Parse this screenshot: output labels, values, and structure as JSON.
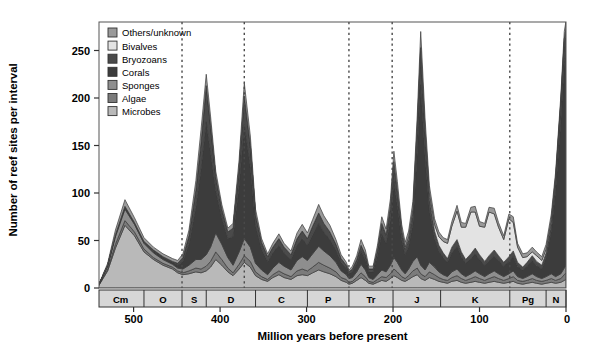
{
  "figure": {
    "ylabel": "Number of reef sites per interval",
    "xlabel": "Million years before present"
  },
  "chart_data": {
    "type": "area",
    "stacked": true,
    "title": "",
    "xlabel": "Million years before present",
    "ylabel": "Number of reef sites per interval",
    "xlim": [
      540,
      0
    ],
    "ylim": [
      0,
      280
    ],
    "x_reversed": true,
    "grid": false,
    "legend_position": "top-left",
    "xticks": [
      500,
      400,
      300,
      200,
      100,
      0
    ],
    "yticks": [
      0,
      50,
      100,
      150,
      200,
      250
    ],
    "colors": {
      "Others/unknown": "#9a9a9a",
      "Bivalves": "#e3e3e3",
      "Bryozoans": "#4a4a4a",
      "Corals": "#3c3c3c",
      "Sponges": "#8e8e8e",
      "Algae": "#7b7b7b",
      "Microbes": "#b9b9b9"
    },
    "legend": [
      "Others/unknown",
      "Bivalves",
      "Bryozoans",
      "Corals",
      "Sponges",
      "Algae",
      "Microbes"
    ],
    "stack_order_bottom_to_top": [
      "Microbes",
      "Algae",
      "Sponges",
      "Corals",
      "Bryozoans",
      "Bivalves",
      "Others/unknown"
    ],
    "x": [
      542,
      530,
      521,
      510,
      499,
      488,
      477,
      466,
      455,
      449,
      443,
      436,
      428,
      422,
      416,
      411,
      405,
      398,
      391,
      385,
      378,
      372,
      365,
      359,
      352,
      345,
      339,
      332,
      326,
      318,
      311,
      305,
      299,
      293,
      286,
      280,
      273,
      266,
      260,
      254,
      251,
      247,
      242,
      237,
      232,
      228,
      223,
      218,
      213,
      208,
      203,
      199,
      195,
      190,
      186,
      182,
      177,
      172,
      168,
      163,
      158,
      152,
      147,
      142,
      137,
      132,
      126,
      121,
      116,
      110,
      105,
      100,
      94,
      89,
      83,
      78,
      72,
      66,
      61,
      56,
      50,
      45,
      39,
      34,
      28,
      23,
      17,
      12,
      6,
      2,
      0
    ],
    "series": [
      {
        "name": "Microbes",
        "values": [
          0,
          18,
          42,
          66,
          55,
          38,
          30,
          24,
          20,
          16,
          14,
          15,
          17,
          16,
          18,
          22,
          30,
          24,
          17,
          13,
          20,
          27,
          22,
          13,
          9,
          7,
          11,
          14,
          11,
          9,
          13,
          14,
          13,
          16,
          19,
          17,
          15,
          12,
          8,
          6,
          4,
          5,
          8,
          11,
          8,
          5,
          4,
          6,
          8,
          7,
          10,
          13,
          11,
          8,
          7,
          9,
          12,
          14,
          10,
          8,
          11,
          9,
          7,
          6,
          5,
          7,
          8,
          6,
          5,
          6,
          7,
          6,
          5,
          6,
          7,
          6,
          5,
          6,
          7,
          5,
          4,
          5,
          6,
          5,
          4,
          5,
          6,
          5,
          6,
          8,
          9
        ]
      },
      {
        "name": "Algae",
        "values": [
          0,
          2,
          4,
          5,
          4,
          3,
          2,
          2,
          2,
          2,
          2,
          3,
          4,
          4,
          5,
          6,
          8,
          6,
          4,
          3,
          5,
          7,
          6,
          4,
          3,
          2,
          3,
          4,
          4,
          3,
          5,
          6,
          5,
          6,
          8,
          7,
          6,
          5,
          3,
          3,
          2,
          2,
          3,
          5,
          4,
          2,
          2,
          3,
          4,
          4,
          5,
          7,
          6,
          4,
          3,
          4,
          6,
          7,
          5,
          4,
          6,
          5,
          4,
          3,
          3,
          4,
          5,
          4,
          3,
          4,
          5,
          4,
          3,
          4,
          5,
          4,
          3,
          4,
          5,
          3,
          3,
          3,
          4,
          3,
          3,
          3,
          4,
          3,
          4,
          6,
          7
        ]
      },
      {
        "name": "Sponges",
        "values": [
          0,
          3,
          8,
          12,
          8,
          6,
          5,
          4,
          3,
          3,
          4,
          6,
          9,
          10,
          12,
          15,
          20,
          16,
          11,
          8,
          13,
          18,
          15,
          9,
          7,
          5,
          7,
          9,
          8,
          7,
          11,
          13,
          11,
          14,
          17,
          15,
          13,
          10,
          7,
          5,
          4,
          4,
          6,
          9,
          7,
          4,
          3,
          5,
          7,
          6,
          9,
          12,
          10,
          7,
          5,
          7,
          10,
          12,
          9,
          7,
          10,
          8,
          6,
          5,
          4,
          6,
          7,
          5,
          4,
          5,
          6,
          5,
          4,
          5,
          6,
          5,
          4,
          5,
          6,
          4,
          3,
          4,
          5,
          4,
          3,
          4,
          5,
          4,
          5,
          7,
          8
        ]
      },
      {
        "name": "Corals",
        "values": [
          0,
          1,
          2,
          3,
          2,
          2,
          2,
          2,
          2,
          3,
          8,
          22,
          55,
          95,
          140,
          100,
          45,
          28,
          20,
          30,
          70,
          120,
          85,
          40,
          22,
          14,
          16,
          18,
          14,
          11,
          16,
          19,
          16,
          20,
          24,
          20,
          17,
          13,
          9,
          7,
          5,
          6,
          9,
          14,
          11,
          6,
          8,
          20,
          38,
          30,
          48,
          80,
          60,
          32,
          20,
          24,
          40,
          110,
          190,
          120,
          55,
          30,
          22,
          18,
          15,
          20,
          24,
          18,
          14,
          16,
          18,
          15,
          12,
          14,
          16,
          14,
          11,
          13,
          15,
          11,
          9,
          11,
          14,
          12,
          10,
          20,
          45,
          90,
          160,
          215,
          225
        ]
      },
      {
        "name": "Bryozoans",
        "values": [
          0,
          0,
          0,
          0,
          0,
          0,
          1,
          1,
          1,
          2,
          4,
          9,
          18,
          28,
          38,
          28,
          14,
          9,
          7,
          9,
          18,
          30,
          22,
          11,
          7,
          5,
          6,
          7,
          6,
          5,
          7,
          8,
          7,
          9,
          11,
          9,
          8,
          6,
          4,
          3,
          2,
          3,
          4,
          6,
          5,
          3,
          3,
          6,
          10,
          8,
          12,
          18,
          14,
          8,
          6,
          7,
          11,
          22,
          35,
          24,
          13,
          8,
          6,
          5,
          4,
          6,
          7,
          5,
          4,
          5,
          6,
          5,
          4,
          5,
          6,
          5,
          4,
          5,
          6,
          4,
          3,
          4,
          5,
          4,
          4,
          5,
          8,
          12,
          18,
          22,
          20
        ]
      },
      {
        "name": "Bivalves",
        "values": [
          0,
          0,
          0,
          0,
          0,
          0,
          0,
          0,
          0,
          0,
          0,
          0,
          0,
          0,
          0,
          0,
          0,
          0,
          0,
          0,
          0,
          0,
          0,
          0,
          0,
          0,
          0,
          0,
          0,
          0,
          0,
          0,
          0,
          0,
          0,
          0,
          0,
          0,
          0,
          0,
          0,
          0,
          0,
          0,
          0,
          0,
          0,
          0,
          1,
          1,
          2,
          3,
          2,
          2,
          2,
          3,
          4,
          5,
          4,
          4,
          5,
          7,
          9,
          12,
          16,
          22,
          30,
          26,
          34,
          44,
          38,
          30,
          36,
          46,
          38,
          30,
          24,
          40,
          30,
          16,
          10,
          6,
          4,
          6,
          5,
          4,
          4,
          3,
          3,
          4,
          4
        ]
      },
      {
        "name": "Others/unknown",
        "values": [
          0,
          2,
          5,
          7,
          5,
          4,
          3,
          3,
          3,
          3,
          4,
          6,
          10,
          14,
          12,
          10,
          6,
          5,
          4,
          5,
          9,
          14,
          10,
          6,
          4,
          3,
          4,
          5,
          4,
          4,
          6,
          7,
          6,
          7,
          9,
          8,
          7,
          5,
          4,
          3,
          2,
          3,
          4,
          6,
          5,
          3,
          3,
          5,
          7,
          6,
          8,
          11,
          9,
          6,
          5,
          6,
          8,
          12,
          17,
          12,
          8,
          6,
          5,
          4,
          4,
          5,
          6,
          5,
          4,
          5,
          6,
          5,
          4,
          5,
          6,
          5,
          4,
          5,
          6,
          4,
          4,
          4,
          5,
          4,
          4,
          5,
          6,
          5,
          6,
          8,
          8
        ]
      }
    ],
    "periods": [
      {
        "label": "Cm",
        "start": 542,
        "end": 488
      },
      {
        "label": "O",
        "start": 488,
        "end": 444
      },
      {
        "label": "S",
        "start": 444,
        "end": 416
      },
      {
        "label": "D",
        "start": 416,
        "end": 359
      },
      {
        "label": "C",
        "start": 359,
        "end": 299
      },
      {
        "label": "P",
        "start": 299,
        "end": 251
      },
      {
        "label": "Tr",
        "start": 251,
        "end": 200
      },
      {
        "label": "J",
        "start": 200,
        "end": 145
      },
      {
        "label": "K",
        "start": 145,
        "end": 65
      },
      {
        "label": "Pg",
        "start": 65,
        "end": 23
      },
      {
        "label": "N",
        "start": 23,
        "end": 0
      }
    ],
    "extinction_markers": [
      444,
      372,
      251,
      201,
      65
    ]
  }
}
